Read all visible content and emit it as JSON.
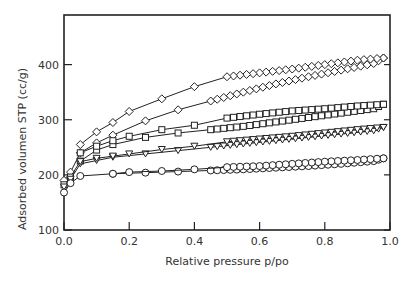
{
  "chart_data": {
    "type": "line",
    "title": "",
    "xlabel": "Relative pressure p/po",
    "ylabel": "Adsorbed volumen STP (cc/g)",
    "xlim": [
      0.0,
      1.0
    ],
    "ylim": [
      100,
      490
    ],
    "xticks": [
      "0.0",
      "0.2",
      "0.4",
      "0.6",
      "0.8",
      "1.0"
    ],
    "yticks": [
      "100",
      "200",
      "300",
      "400"
    ],
    "grid": false,
    "legend": "none",
    "series": [
      {
        "name": "diamond-adsorption",
        "marker": "diamond",
        "x": [
          0.0,
          0.02,
          0.05,
          0.1,
          0.15,
          0.25,
          0.35,
          0.45,
          0.55,
          0.65,
          0.75,
          0.85,
          0.95,
          0.98
        ],
        "y": [
          190,
          205,
          240,
          258,
          272,
          298,
          318,
          334,
          350,
          365,
          378,
          390,
          402,
          412
        ]
      },
      {
        "name": "diamond-desorption",
        "marker": "diamond",
        "x": [
          0.98,
          0.9,
          0.8,
          0.7,
          0.6,
          0.5,
          0.4,
          0.3,
          0.2,
          0.15,
          0.1,
          0.05
        ],
        "y": [
          412,
          408,
          400,
          392,
          385,
          378,
          360,
          338,
          315,
          295,
          278,
          255
        ]
      },
      {
        "name": "square-adsorption",
        "marker": "square",
        "x": [
          0.0,
          0.02,
          0.05,
          0.1,
          0.15,
          0.25,
          0.35,
          0.45,
          0.55,
          0.65,
          0.75,
          0.85,
          0.95,
          0.98
        ],
        "y": [
          182,
          196,
          225,
          245,
          255,
          268,
          276,
          282,
          288,
          296,
          304,
          312,
          320,
          328
        ]
      },
      {
        "name": "square-desorption",
        "marker": "square",
        "x": [
          0.98,
          0.9,
          0.8,
          0.7,
          0.6,
          0.5,
          0.4,
          0.3,
          0.2,
          0.15,
          0.1,
          0.05
        ],
        "y": [
          328,
          325,
          320,
          316,
          310,
          303,
          290,
          282,
          270,
          262,
          252,
          240
        ]
      },
      {
        "name": "triangle-adsorption",
        "marker": "triangle-down",
        "x": [
          0.0,
          0.02,
          0.05,
          0.1,
          0.15,
          0.25,
          0.35,
          0.45,
          0.55,
          0.65,
          0.75,
          0.85,
          0.95,
          0.98
        ],
        "y": [
          178,
          192,
          220,
          226,
          232,
          238,
          244,
          250,
          256,
          262,
          268,
          274,
          280,
          286
        ]
      },
      {
        "name": "triangle-desorption",
        "marker": "triangle-down",
        "x": [
          0.98,
          0.9,
          0.8,
          0.7,
          0.6,
          0.5,
          0.4,
          0.3,
          0.2,
          0.15,
          0.1,
          0.05
        ],
        "y": [
          286,
          282,
          276,
          270,
          265,
          260,
          252,
          246,
          238,
          234,
          230,
          224
        ]
      },
      {
        "name": "circle-adsorption",
        "marker": "circle",
        "x": [
          0.0,
          0.02,
          0.05,
          0.15,
          0.25,
          0.35,
          0.45,
          0.55,
          0.65,
          0.75,
          0.85,
          0.95,
          0.98
        ],
        "y": [
          168,
          185,
          198,
          202,
          204,
          206,
          208,
          210,
          213,
          216,
          220,
          225,
          230
        ]
      },
      {
        "name": "circle-desorption",
        "marker": "circle",
        "x": [
          0.98,
          0.9,
          0.8,
          0.7,
          0.6,
          0.5,
          0.4,
          0.3,
          0.2,
          0.15
        ],
        "y": [
          230,
          227,
          224,
          220,
          216,
          214,
          210,
          207,
          205,
          202
        ]
      }
    ]
  }
}
